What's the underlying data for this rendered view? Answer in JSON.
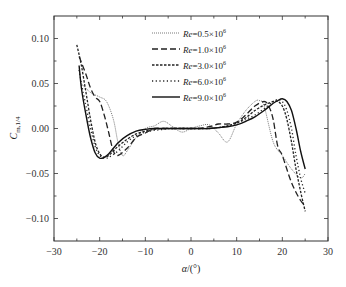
{
  "chart_data": {
    "type": "line",
    "title": "",
    "xlabel": "α/(°)",
    "ylabel": "C_m,1/4",
    "xlim": [
      -30,
      30
    ],
    "ylim": [
      -0.125,
      0.125
    ],
    "xticks": [
      -30,
      -20,
      -10,
      0,
      10,
      20,
      30
    ],
    "xtick_labels": [
      "−30",
      "−20",
      "−10",
      "0",
      "10",
      "20",
      "30"
    ],
    "yticks": [
      0.1,
      0.05,
      0.0,
      -0.05,
      -0.1
    ],
    "ytick_labels": [
      "0.10",
      "0.05",
      "0.00",
      "−0.05",
      "−0.10"
    ],
    "grid": false,
    "legend_position": "upper center",
    "series": [
      {
        "name": "Re=0.5×10^6",
        "style": "dotted-fine",
        "x": [
          -24,
          -22,
          -20,
          -18.5,
          -17,
          -16,
          -15,
          -14,
          -12,
          -10,
          -8,
          -6,
          -4,
          -2,
          0,
          2,
          4,
          6,
          8,
          10,
          12,
          14,
          15,
          16,
          18,
          20,
          22,
          24,
          25
        ],
        "y": [
          0.05,
          0.04,
          0.035,
          0.03,
          0.01,
          -0.015,
          -0.03,
          -0.025,
          -0.01,
          0.0,
          0.003,
          0.008,
          0.002,
          -0.004,
          0.0,
          0.003,
          0.004,
          -0.005,
          -0.015,
          0.005,
          0.02,
          0.03,
          0.031,
          0.025,
          -0.015,
          -0.03,
          -0.045,
          -0.055,
          -0.05
        ]
      },
      {
        "name": "Re=1.0×10^6",
        "style": "dashed",
        "x": [
          -24.5,
          -23,
          -22,
          -21,
          -20,
          -19,
          -18,
          -17,
          -16,
          -14,
          -12,
          -10,
          -8,
          -6,
          -4,
          -2,
          0,
          2,
          4,
          6,
          8,
          10,
          12,
          14,
          16,
          17,
          18,
          19,
          20,
          22,
          24,
          25
        ],
        "y": [
          0.08,
          0.06,
          0.045,
          0.035,
          0.03,
          0.015,
          -0.005,
          -0.025,
          -0.03,
          -0.022,
          -0.01,
          -0.005,
          0.0,
          0.0,
          0.0,
          0.0,
          0.0,
          0.0,
          0.002,
          0.005,
          0.005,
          0.007,
          0.015,
          0.025,
          0.03,
          0.025,
          0.01,
          -0.02,
          -0.03,
          -0.06,
          -0.08,
          -0.085
        ]
      },
      {
        "name": "Re=3.0×10^6",
        "style": "short-dash",
        "x": [
          -25,
          -24,
          -23,
          -22,
          -21,
          -20,
          -19,
          -18,
          -17,
          -16,
          -14,
          -12,
          -10,
          -8,
          -6,
          -4,
          -2,
          0,
          2,
          4,
          6,
          8,
          10,
          12,
          14,
          16,
          18,
          19,
          20,
          21,
          22,
          23,
          24,
          25
        ],
        "y": [
          0.093,
          0.07,
          0.04,
          0.01,
          -0.015,
          -0.028,
          -0.032,
          -0.03,
          -0.025,
          -0.02,
          -0.012,
          -0.006,
          -0.003,
          -0.001,
          0.0,
          0.0,
          0.0,
          0.0,
          0.0,
          0.0,
          0.001,
          0.003,
          0.006,
          0.012,
          0.02,
          0.026,
          0.03,
          0.03,
          0.025,
          0.01,
          -0.015,
          -0.045,
          -0.07,
          -0.092
        ]
      },
      {
        "name": "Re=6.0×10^6",
        "style": "dotted",
        "x": [
          -24.5,
          -24,
          -23,
          -22,
          -21,
          -20,
          -19,
          -18,
          -16,
          -14,
          -12,
          -10,
          -8,
          -6,
          -4,
          -2,
          0,
          2,
          4,
          6,
          8,
          10,
          12,
          14,
          16,
          18,
          19,
          20,
          21,
          22,
          23,
          24,
          25
        ],
        "y": [
          0.065,
          0.05,
          0.025,
          0.0,
          -0.02,
          -0.03,
          -0.033,
          -0.032,
          -0.025,
          -0.015,
          -0.008,
          -0.004,
          -0.002,
          -0.001,
          0.0,
          0.0,
          0.0,
          0.0,
          0.0,
          0.001,
          0.003,
          0.006,
          0.01,
          0.015,
          0.022,
          0.03,
          0.032,
          0.03,
          0.02,
          0.0,
          -0.03,
          -0.055,
          -0.072
        ]
      },
      {
        "name": "Re=9.0×10^6",
        "style": "solid",
        "x": [
          -24.5,
          -24,
          -23,
          -22,
          -21,
          -20,
          -19,
          -18,
          -16,
          -14,
          -12,
          -10,
          -8,
          -6,
          -4,
          -2,
          0,
          2,
          4,
          6,
          8,
          10,
          12,
          14,
          16,
          18,
          19,
          20,
          21,
          22,
          23,
          24,
          25
        ],
        "y": [
          0.07,
          0.045,
          0.015,
          -0.01,
          -0.027,
          -0.033,
          -0.032,
          -0.028,
          -0.016,
          -0.008,
          -0.003,
          -0.001,
          0.0,
          0.0,
          0.0,
          0.0,
          0.0,
          0.0,
          0.0,
          0.001,
          0.002,
          0.004,
          0.008,
          0.013,
          0.02,
          0.028,
          0.031,
          0.033,
          0.03,
          0.02,
          0.0,
          -0.025,
          -0.045
        ]
      }
    ]
  },
  "legend": {
    "items": [
      {
        "prefix": "Re",
        "value": "=0.5×10",
        "exp": "6"
      },
      {
        "prefix": "Re",
        "value": "=1.0×10",
        "exp": "6"
      },
      {
        "prefix": "Re",
        "value": "=3.0×10",
        "exp": "6"
      },
      {
        "prefix": "Re",
        "value": "=6.0×10",
        "exp": "6"
      },
      {
        "prefix": "Re",
        "value": "=9.0×10",
        "exp": "6"
      }
    ]
  },
  "axes": {
    "x_title_symbol": "α",
    "x_title_rest": "/(°)",
    "y_title_main": "C",
    "y_title_sub": "m,1/4"
  }
}
